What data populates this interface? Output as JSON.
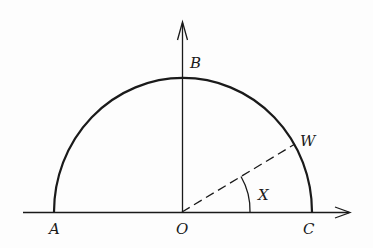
{
  "diagram": {
    "type": "semicircle-geometry",
    "colors": {
      "stroke": "#1a1a1a",
      "background": "#fdfdfd"
    },
    "points": {
      "A": {
        "label": "A",
        "x": 54,
        "y": 212
      },
      "O": {
        "label": "O",
        "x": 182,
        "y": 212
      },
      "C": {
        "label": "C",
        "x": 312,
        "y": 212
      },
      "B": {
        "label": "B",
        "x": 182,
        "y": 79
      },
      "W": {
        "label": "W",
        "x": 295,
        "y": 144
      }
    },
    "angle": {
      "label": "X",
      "vertex": "O",
      "from": "C",
      "to": "W"
    },
    "axes": {
      "horizontal": {
        "from_x": 23,
        "to_x": 350,
        "y": 212,
        "arrow": "right"
      },
      "vertical": {
        "x": 182,
        "from_y": 212,
        "to_y": 22,
        "arrow": "up"
      }
    }
  }
}
